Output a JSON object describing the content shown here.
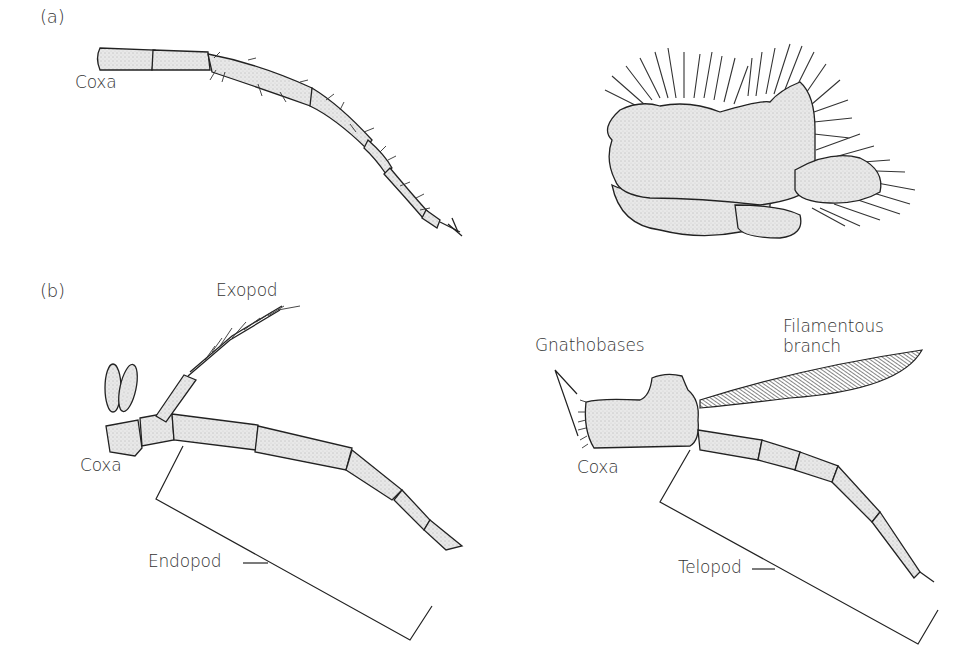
{
  "figure": {
    "panels": [
      {
        "id": "a",
        "label": "(a)",
        "drawings": [
          {
            "name": "walking-leg",
            "labels": {
              "coxa": "Coxa"
            }
          },
          {
            "name": "setose-limb-lobes",
            "labels": {}
          }
        ]
      },
      {
        "id": "b",
        "label": "(b)",
        "drawings": [
          {
            "name": "biramous-leg",
            "labels": {
              "exopod": "Exopod",
              "coxa": "Coxa",
              "endopod": "Endopod"
            }
          },
          {
            "name": "uniramous-leg-with-filament",
            "labels": {
              "gnathobases": "Gnathobases",
              "filamentous_branch_line1": "Filamentous",
              "filamentous_branch_line2": "branch",
              "coxa": "Coxa",
              "telopod": "Telopod"
            }
          }
        ]
      }
    ],
    "colors": {
      "fill": "#e6e6e6",
      "stroke": "#222222",
      "label": "#333333"
    }
  }
}
